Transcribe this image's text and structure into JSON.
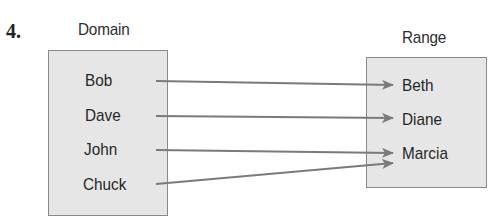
{
  "problem_number": "4.",
  "domain": {
    "label": "Domain",
    "items": [
      "Bob",
      "Dave",
      "John",
      "Chuck"
    ]
  },
  "range": {
    "label": "Range",
    "items": [
      "Beth",
      "Diane",
      "Marcia"
    ]
  },
  "mappings": [
    {
      "from": "Bob",
      "to": "Beth"
    },
    {
      "from": "Dave",
      "to": "Diane"
    },
    {
      "from": "John",
      "to": "Marcia"
    },
    {
      "from": "Chuck",
      "to": "Marcia"
    }
  ],
  "colors": {
    "box_fill": "#e6e6e6",
    "box_border": "#8a8a8a",
    "arrow": "#7a7a7a"
  }
}
